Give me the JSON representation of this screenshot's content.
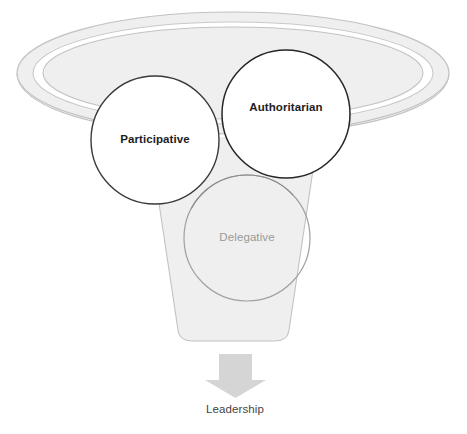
{
  "diagram": {
    "type": "funnel-venn",
    "title": "",
    "funnel": {
      "name": "leadership-funnel",
      "fill_color": "#efefef",
      "stroke_color": "#bdbdbd",
      "rim_band_color": "#ffffff"
    },
    "circles": [
      {
        "id": "participative",
        "label": "Participative",
        "fill_color": "#ffffff",
        "stroke_color": "#333333",
        "text_color": "#1d1d1d",
        "bold": true,
        "cx": 155,
        "cy": 140,
        "r": 64
      },
      {
        "id": "authoritarian",
        "label": "Authoritarian",
        "fill_color": "#ffffff",
        "stroke_color": "#222222",
        "text_color": "#1d1d1d",
        "bold": true,
        "cx": 286,
        "cy": 114,
        "r": 64
      },
      {
        "id": "delegative",
        "label": "Delegative",
        "fill_color": "transparent",
        "stroke_color": "#a0a0a0",
        "text_color": "#9a9a9a",
        "bold": false,
        "cx": 247,
        "cy": 238,
        "r": 63
      }
    ],
    "arrow": {
      "name": "down-arrow",
      "fill_color": "#d5d5d5",
      "direction": "down"
    },
    "outcome": {
      "label": "Leadership",
      "text_color": "#444444"
    }
  }
}
